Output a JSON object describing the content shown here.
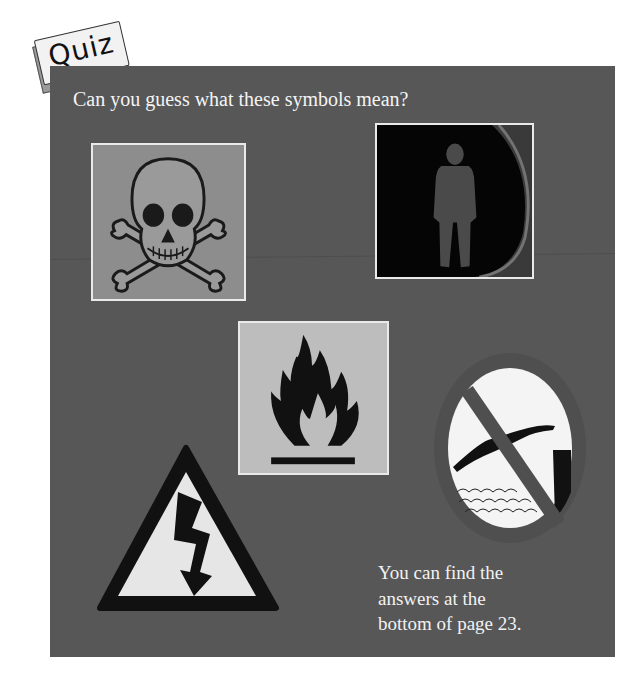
{
  "header": {
    "tag_label": "Quiz",
    "question": "Can you guess what these symbols mean?"
  },
  "symbols": [
    {
      "name": "skull-and-crossbones",
      "description": "Poison warning symbol photo"
    },
    {
      "name": "pedestrian-signal",
      "description": "Standing person traffic light photo"
    },
    {
      "name": "flammable",
      "description": "Flame symbol photo"
    },
    {
      "name": "no-diving",
      "description": "Diver with prohibition slash"
    },
    {
      "name": "high-voltage",
      "description": "Lightning bolt in warning triangle"
    }
  ],
  "answer_note": {
    "line1": "You can find the",
    "line2": "answers at the",
    "line3": "bottom of page 23."
  },
  "colors": {
    "panel": "#575757",
    "text": "#f2f2f2",
    "tag_fill": "#f2f2f2"
  }
}
